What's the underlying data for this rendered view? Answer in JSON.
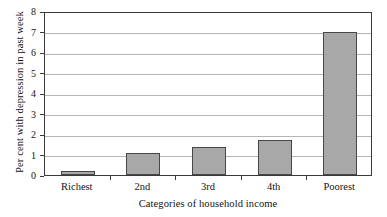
{
  "chart_data": {
    "type": "bar",
    "title": "",
    "categories": [
      "Richest",
      "2nd",
      "3rd",
      "4th",
      "Poorest"
    ],
    "values": [
      0.2,
      1.05,
      1.35,
      1.7,
      7.0
    ],
    "xlabel": "Categories of household income",
    "ylabel": "Per cent with depression in past week",
    "ylim": [
      0,
      8
    ],
    "yticks": [
      0,
      1,
      2,
      3,
      4,
      5,
      6,
      7,
      8
    ],
    "ytick_labels": [
      "0",
      "1",
      "2",
      "3",
      "4",
      "5",
      "6",
      "7",
      "8"
    ],
    "grid": true,
    "grid_axis": "y",
    "legend": false,
    "bar_fill_color": "#a8a8a8",
    "bar_edge_color": "#474747",
    "grid_color": "#b4b4b4",
    "axis_color": "#3a3a3a",
    "background_color": "#ffffff"
  }
}
